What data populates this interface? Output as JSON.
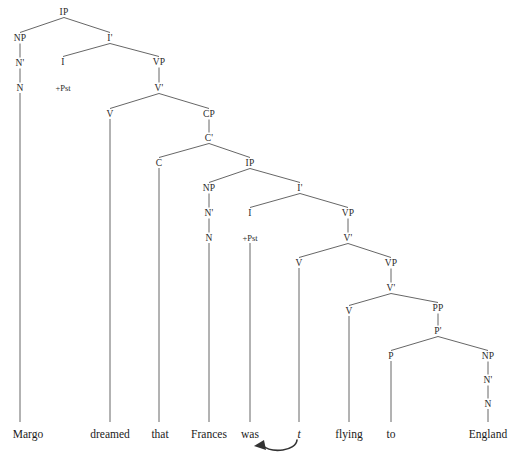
{
  "diagram": {
    "type": "x-bar-syntax-tree",
    "sentence": "Margo dreamed that Frances was t flying to England",
    "canvas": {
      "width": 524,
      "height": 455
    },
    "style": {
      "line_color": "#555555",
      "text_color": "#222222",
      "background": "#ffffff"
    }
  },
  "nodes": [
    {
      "id": "IP1",
      "label": "IP",
      "x": 64,
      "y": 12
    },
    {
      "id": "NP1",
      "label": "NP",
      "x": 20,
      "y": 38
    },
    {
      "id": "Ibar1",
      "label": "I'",
      "x": 110,
      "y": 38
    },
    {
      "id": "Nbar1",
      "label": "N'",
      "x": 20,
      "y": 63
    },
    {
      "id": "I1",
      "label": "I",
      "x": 63,
      "y": 62
    },
    {
      "id": "VP1",
      "label": "VP",
      "x": 159,
      "y": 62
    },
    {
      "id": "N1",
      "label": "N",
      "x": 20,
      "y": 88
    },
    {
      "id": "Pst1",
      "label": "+Pst",
      "x": 63,
      "y": 88
    },
    {
      "id": "Vbar1",
      "label": "V'",
      "x": 159,
      "y": 88
    },
    {
      "id": "V1",
      "label": "V",
      "x": 110,
      "y": 114
    },
    {
      "id": "CP1",
      "label": "CP",
      "x": 209,
      "y": 114
    },
    {
      "id": "Cbar1",
      "label": "C'",
      "x": 209,
      "y": 138
    },
    {
      "id": "C1",
      "label": "C",
      "x": 159,
      "y": 163
    },
    {
      "id": "IP2",
      "label": "IP",
      "x": 250,
      "y": 163
    },
    {
      "id": "NP2",
      "label": "NP",
      "x": 209,
      "y": 188
    },
    {
      "id": "Ibar2",
      "label": "I'",
      "x": 300,
      "y": 188
    },
    {
      "id": "Nbar2",
      "label": "N'",
      "x": 209,
      "y": 213
    },
    {
      "id": "I2",
      "label": "I",
      "x": 250,
      "y": 213
    },
    {
      "id": "VP2",
      "label": "VP",
      "x": 348,
      "y": 213
    },
    {
      "id": "N2",
      "label": "N",
      "x": 209,
      "y": 238
    },
    {
      "id": "Pst2",
      "label": "+Pst",
      "x": 250,
      "y": 238
    },
    {
      "id": "Vbar2",
      "label": "V'",
      "x": 348,
      "y": 238
    },
    {
      "id": "V2",
      "label": "V",
      "x": 299,
      "y": 263
    },
    {
      "id": "VP3",
      "label": "VP",
      "x": 391,
      "y": 263
    },
    {
      "id": "Vbar3",
      "label": "V'",
      "x": 391,
      "y": 288
    },
    {
      "id": "V3",
      "label": "V",
      "x": 349,
      "y": 311
    },
    {
      "id": "PP1",
      "label": "PP",
      "x": 438,
      "y": 308
    },
    {
      "id": "Pbar1",
      "label": "P'",
      "x": 438,
      "y": 331
    },
    {
      "id": "P1",
      "label": "P",
      "x": 391,
      "y": 356
    },
    {
      "id": "NP3",
      "label": "NP",
      "x": 488,
      "y": 356
    },
    {
      "id": "Nbar3",
      "label": "N'",
      "x": 488,
      "y": 380
    },
    {
      "id": "N3",
      "label": "N",
      "x": 488,
      "y": 404
    }
  ],
  "edges": [
    {
      "from": "IP1",
      "to": "NP1"
    },
    {
      "from": "IP1",
      "to": "Ibar1"
    },
    {
      "from": "NP1",
      "to": "Nbar1"
    },
    {
      "from": "Nbar1",
      "to": "N1"
    },
    {
      "from": "Ibar1",
      "to": "I1"
    },
    {
      "from": "Ibar1",
      "to": "VP1"
    },
    {
      "from": "VP1",
      "to": "Vbar1"
    },
    {
      "from": "Vbar1",
      "to": "V1"
    },
    {
      "from": "Vbar1",
      "to": "CP1"
    },
    {
      "from": "CP1",
      "to": "Cbar1"
    },
    {
      "from": "Cbar1",
      "to": "C1"
    },
    {
      "from": "Cbar1",
      "to": "IP2"
    },
    {
      "from": "IP2",
      "to": "NP2"
    },
    {
      "from": "IP2",
      "to": "Ibar2"
    },
    {
      "from": "NP2",
      "to": "Nbar2"
    },
    {
      "from": "Nbar2",
      "to": "N2"
    },
    {
      "from": "Ibar2",
      "to": "I2"
    },
    {
      "from": "Ibar2",
      "to": "VP2"
    },
    {
      "from": "VP2",
      "to": "Vbar2"
    },
    {
      "from": "Vbar2",
      "to": "V2"
    },
    {
      "from": "Vbar2",
      "to": "VP3"
    },
    {
      "from": "VP3",
      "to": "Vbar3"
    },
    {
      "from": "Vbar3",
      "to": "V3"
    },
    {
      "from": "Vbar3",
      "to": "PP1"
    },
    {
      "from": "PP1",
      "to": "Pbar1"
    },
    {
      "from": "Pbar1",
      "to": "P1"
    },
    {
      "from": "Pbar1",
      "to": "NP3"
    },
    {
      "from": "NP3",
      "to": "Nbar3"
    },
    {
      "from": "Nbar3",
      "to": "N3"
    }
  ],
  "terminals": [
    {
      "id": "w-margo",
      "text": "Margo",
      "x": 28,
      "y": 434,
      "italic": false,
      "stem_from": "N1",
      "stem_x": 20,
      "stem_y1": 93,
      "stem_y2": 422
    },
    {
      "id": "w-dreamed",
      "text": "dreamed",
      "x": 110,
      "y": 434,
      "italic": false,
      "stem_from": "V1",
      "stem_x": 110,
      "stem_y1": 119,
      "stem_y2": 422
    },
    {
      "id": "w-that",
      "text": "that",
      "x": 160,
      "y": 434,
      "italic": false,
      "stem_from": "C1",
      "stem_x": 159,
      "stem_y1": 168,
      "stem_y2": 422
    },
    {
      "id": "w-frances",
      "text": "Frances",
      "x": 209,
      "y": 434,
      "italic": false,
      "stem_from": "N2",
      "stem_x": 209,
      "stem_y1": 243,
      "stem_y2": 422
    },
    {
      "id": "w-was",
      "text": "was",
      "x": 250,
      "y": 434,
      "italic": false,
      "stem_from": "Pst2",
      "stem_x": 250,
      "stem_y1": 243,
      "stem_y2": 422
    },
    {
      "id": "w-trace",
      "text": "t",
      "x": 299,
      "y": 434,
      "italic": true,
      "stem_from": "V2",
      "stem_x": 299,
      "stem_y1": 268,
      "stem_y2": 422
    },
    {
      "id": "w-flying",
      "text": "flying",
      "x": 349,
      "y": 434,
      "italic": false,
      "stem_from": "V3",
      "stem_x": 349,
      "stem_y1": 316,
      "stem_y2": 422
    },
    {
      "id": "w-to",
      "text": "to",
      "x": 391,
      "y": 434,
      "italic": false,
      "stem_from": "P1",
      "stem_x": 391,
      "stem_y1": 361,
      "stem_y2": 422
    },
    {
      "id": "w-england",
      "text": "England",
      "x": 488,
      "y": 434,
      "italic": false,
      "stem_from": "N3",
      "stem_x": 488,
      "stem_y1": 409,
      "stem_y2": 422
    }
  ],
  "movement_arrow": {
    "id": "trace-movement-arrow",
    "from_word": "t",
    "to_word": "was",
    "description": "curved arrow from trace t back to was"
  }
}
